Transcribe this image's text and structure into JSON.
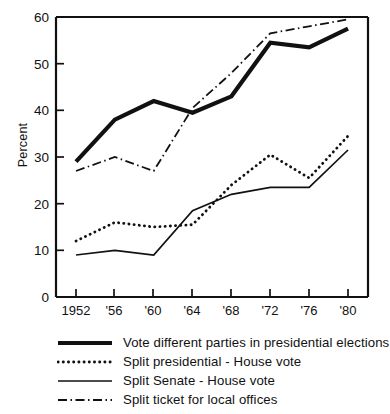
{
  "chart_data": {
    "type": "line",
    "title": "",
    "xlabel": "",
    "ylabel": "Percent",
    "ylim": [
      0,
      60
    ],
    "yticks": [
      0,
      10,
      20,
      30,
      40,
      50,
      60
    ],
    "ytick_labels": [
      "0",
      "10",
      "20",
      "30",
      "40",
      "50",
      "60"
    ],
    "grid": false,
    "legend_position": "below",
    "categories": [
      "1952",
      "'56",
      "'60",
      "'64",
      "'68",
      "'72",
      "'76",
      "'80"
    ],
    "x": [
      1952,
      1956,
      1960,
      1964,
      1968,
      1972,
      1976,
      1980
    ],
    "series": [
      {
        "name": "Vote different parties in presidential elections",
        "style": "thick-solid",
        "values": [
          29,
          38,
          42,
          39.5,
          43,
          54.5,
          53.5,
          57.5
        ]
      },
      {
        "name": "Split presidential - House vote",
        "style": "dotted",
        "values": [
          12,
          16,
          15,
          15.5,
          24,
          30.5,
          25.5,
          34.5
        ]
      },
      {
        "name": "Split Senate - House vote",
        "style": "thin-solid",
        "values": [
          9,
          10,
          9,
          18.5,
          22,
          23.5,
          23.5,
          31.5
        ]
      },
      {
        "name": "Split ticket for local offices",
        "style": "dash-dot",
        "values": [
          27,
          30,
          27,
          40.5,
          48,
          56.5,
          58,
          59.5
        ]
      }
    ]
  },
  "axes": {
    "y_title": "Percent",
    "y_tick_labels": [
      "60",
      "50",
      "40",
      "30",
      "20",
      "10",
      "0"
    ],
    "x_tick_labels": [
      "1952",
      "'56",
      "'60",
      "'64",
      "'68",
      "'72",
      "'76",
      "'80"
    ]
  },
  "legend": {
    "items": [
      {
        "label": "Vote different parties in presidential elections",
        "style": "thick-solid"
      },
      {
        "label": "Split presidential - House vote",
        "style": "dotted"
      },
      {
        "label": "Split Senate - House vote",
        "style": "thin-solid"
      },
      {
        "label": "Split ticket for local offices",
        "style": "dash-dot"
      }
    ]
  },
  "colors": {
    "ink": "#111111",
    "background": "#ffffff"
  }
}
